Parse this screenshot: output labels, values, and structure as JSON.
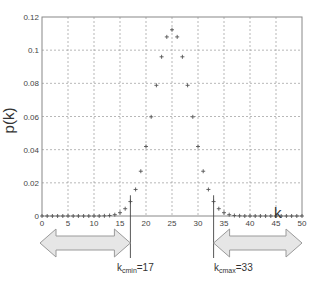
{
  "chart_data": {
    "type": "scatter",
    "title": "",
    "xlabel": "k",
    "ylabel": "p(k)",
    "xlim": [
      0,
      50
    ],
    "ylim": [
      0,
      0.12
    ],
    "xticks": [
      0,
      5,
      10,
      15,
      20,
      25,
      30,
      35,
      40,
      45,
      50
    ],
    "yticks": [
      0,
      0.02,
      0.04,
      0.06,
      0.08,
      0.1,
      0.12
    ],
    "ytick_labels": [
      "0",
      "0.02",
      "0.04",
      "0.06",
      "0.08",
      "0.1",
      "0.12"
    ],
    "grid": true,
    "marker": "+",
    "series": [
      {
        "name": "p(k)",
        "x": [
          0,
          1,
          2,
          3,
          4,
          5,
          6,
          7,
          8,
          9,
          10,
          11,
          12,
          13,
          14,
          15,
          16,
          17,
          18,
          19,
          20,
          21,
          22,
          23,
          24,
          25,
          26,
          27,
          28,
          29,
          30,
          31,
          32,
          33,
          34,
          35,
          36,
          37,
          38,
          39,
          40,
          41,
          42,
          43,
          44,
          45,
          46,
          47,
          48,
          49,
          50
        ],
        "values": [
          0,
          0,
          0,
          0,
          0,
          0,
          0,
          0,
          0,
          0,
          0,
          0,
          0.0001,
          0.0003,
          0.0008,
          0.002,
          0.0044,
          0.0087,
          0.016,
          0.027,
          0.0419,
          0.0598,
          0.0788,
          0.096,
          0.108,
          0.1123,
          0.108,
          0.096,
          0.0788,
          0.0598,
          0.0419,
          0.027,
          0.016,
          0.0087,
          0.0044,
          0.002,
          0.0008,
          0.0003,
          0.0001,
          0,
          0,
          0,
          0,
          0,
          0,
          0,
          0,
          0,
          0,
          0,
          0
        ]
      }
    ],
    "annotations": [
      {
        "type": "vline",
        "x": 17,
        "label_main": "k",
        "label_sub": "cmin",
        "label_value": "=17"
      },
      {
        "type": "vline",
        "x": 33,
        "label_main": "k",
        "label_sub": "cmax",
        "label_value": "=33"
      },
      {
        "type": "double-arrow",
        "from": 0,
        "to": 17
      },
      {
        "type": "double-arrow",
        "from": 33,
        "to": 50
      }
    ],
    "colors": {
      "marker": "#555555",
      "grid": "#999999",
      "arrow_fill": "#e6e6e6",
      "arrow_stroke": "#9a9a9a",
      "axis": "#444444"
    }
  },
  "labels": {
    "xlabel": "k",
    "ylabel": "p(k)",
    "kmin_main": "k",
    "kmin_sub": "cmin",
    "kmin_value": "=17",
    "kmax_main": "k",
    "kmax_sub": "cmax",
    "kmax_value": "=33"
  }
}
